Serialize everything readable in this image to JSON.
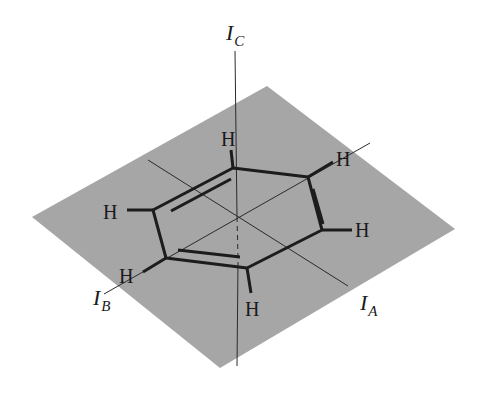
{
  "diagram": {
    "colors": {
      "plane": "#a6a6a6",
      "bond": "#1c1c1c",
      "axis": "#2a2a2a",
      "background": "#ffffff"
    },
    "plane": {
      "corners": [
        [
          267,
          86
        ],
        [
          455,
          229
        ],
        [
          220,
          368
        ],
        [
          32,
          217
        ]
      ]
    },
    "axes": [
      {
        "id": "IC",
        "label": "I",
        "subscript": "C",
        "label_pos": [
          226,
          40
        ],
        "from": [
          235,
          51
        ],
        "to": [
          237,
          366
        ]
      },
      {
        "id": "IA",
        "label": "I",
        "subscript": "A",
        "label_pos": [
          360,
          310
        ],
        "from": [
          148,
          160
        ],
        "to": [
          348,
          286
        ]
      },
      {
        "id": "IB",
        "label": "I",
        "subscript": "B",
        "label_pos": [
          93,
          305
        ],
        "from": [
          104,
          294
        ],
        "to": [
          370,
          143
        ]
      }
    ],
    "ring": {
      "center": [
        237,
        217
      ],
      "vertices": [
        [
          233,
          168
        ],
        [
          308,
          177
        ],
        [
          322,
          230
        ],
        [
          247,
          268
        ],
        [
          166,
          258
        ],
        [
          153,
          210
        ]
      ],
      "double_bond_inner_lines": [
        [
          [
            171,
            211
          ],
          [
            231,
            179
          ]
        ],
        [
          [
            313,
            189
          ],
          [
            323,
            224
          ]
        ],
        [
          [
            178,
            250
          ],
          [
            240,
            257
          ]
        ]
      ]
    },
    "hydrogens": [
      {
        "label": "H",
        "vertex": 0,
        "bond_end": [
          231,
          150
        ],
        "text_pos": [
          221,
          146
        ]
      },
      {
        "label": "H",
        "vertex": 1,
        "bond_end": [
          333,
          162
        ],
        "text_pos": [
          336,
          166
        ]
      },
      {
        "label": "H",
        "vertex": 2,
        "bond_end": [
          352,
          230
        ],
        "text_pos": [
          355,
          237
        ]
      },
      {
        "label": "H",
        "vertex": 3,
        "bond_end": [
          251,
          293
        ],
        "text_pos": [
          245,
          316
        ]
      },
      {
        "label": "H",
        "vertex": 4,
        "bond_end": [
          143,
          272
        ],
        "text_pos": [
          119,
          283
        ]
      },
      {
        "label": "H",
        "vertex": 5,
        "bond_end": [
          127,
          210
        ],
        "text_pos": [
          103,
          219
        ]
      }
    ]
  }
}
